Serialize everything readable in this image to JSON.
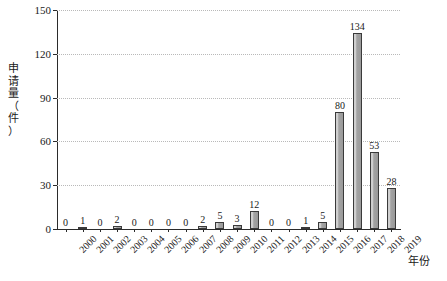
{
  "chart_data": {
    "type": "bar",
    "title": "",
    "xlabel": "年份",
    "ylabel": "申请量（件）",
    "ylim": [
      0,
      150
    ],
    "yticks": [
      0,
      30,
      60,
      90,
      120,
      150
    ],
    "grid": "horizontal-dotted",
    "legend": "none",
    "categories": [
      "2000",
      "2001",
      "2002",
      "2003",
      "2004",
      "2005",
      "2006",
      "2007",
      "2008",
      "2009",
      "2010",
      "2011",
      "2012",
      "2013",
      "2014",
      "2015",
      "2016",
      "2017",
      "2018",
      "2019"
    ],
    "values": [
      0,
      1,
      0,
      2,
      0,
      0,
      0,
      0,
      2,
      5,
      3,
      12,
      0,
      0,
      1,
      5,
      80,
      134,
      53,
      28
    ],
    "value_labels": [
      "0",
      "1",
      "0",
      "2",
      "0",
      "0",
      "0",
      "0",
      "2",
      "5",
      "3",
      "12",
      "0",
      "0",
      "1",
      "5",
      "80",
      "134",
      "53",
      "28"
    ],
    "bar_color": "#a6a6a6",
    "bar_edge_color": "#3a3a3a",
    "axis_color": "#2b2b2b",
    "grid_color": "#b9b9b9"
  },
  "axes": {
    "y_title_chars": [
      "申",
      "请",
      "量",
      "（",
      "件",
      "）"
    ],
    "y_tick_labels": [
      "150",
      "120",
      "90",
      "60",
      "30",
      "0"
    ],
    "x_title": "年份"
  },
  "caption": {
    "text": ""
  }
}
